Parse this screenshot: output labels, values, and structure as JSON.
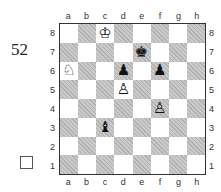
{
  "puzzle": {
    "number": "52",
    "checkbox_checked": false
  },
  "board": {
    "files": [
      "a",
      "b",
      "c",
      "d",
      "e",
      "f",
      "g",
      "h"
    ],
    "ranks": [
      "8",
      "7",
      "6",
      "5",
      "4",
      "3",
      "2",
      "1"
    ],
    "pieces": [
      {
        "square": "c8",
        "color": "white",
        "type": "king",
        "glyph": "♔"
      },
      {
        "square": "e7",
        "color": "black",
        "type": "king",
        "glyph": "♚"
      },
      {
        "square": "a6",
        "color": "white",
        "type": "knight",
        "glyph": "♘"
      },
      {
        "square": "d6",
        "color": "black",
        "type": "pawn",
        "glyph": "♟"
      },
      {
        "square": "f6",
        "color": "black",
        "type": "pawn",
        "glyph": "♟"
      },
      {
        "square": "d5",
        "color": "white",
        "type": "pawn",
        "glyph": "♙"
      },
      {
        "square": "f4",
        "color": "white",
        "type": "pawn",
        "glyph": "♙"
      },
      {
        "square": "c3",
        "color": "black",
        "type": "bishop",
        "glyph": "♝"
      }
    ]
  }
}
